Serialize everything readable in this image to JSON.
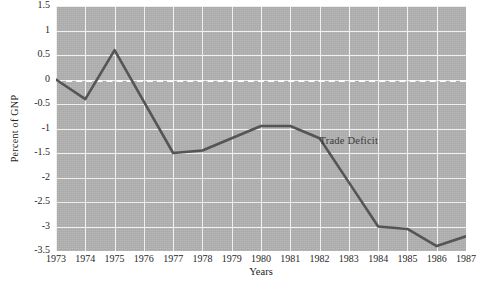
{
  "chart_data": {
    "type": "line",
    "title": "",
    "xlabel": "Years",
    "ylabel": "Percent of GNP",
    "categories": [
      "1973",
      "1974",
      "1975",
      "1976",
      "1977",
      "1978",
      "1979",
      "1980",
      "1981",
      "1982",
      "1983",
      "1984",
      "1985",
      "1986",
      "1987"
    ],
    "series": [
      {
        "name": "Trade Deficit",
        "values": [
          0.0,
          -0.4,
          0.6,
          -0.45,
          -1.5,
          -1.45,
          -1.2,
          -0.95,
          -0.95,
          -1.2,
          -2.1,
          -3.0,
          -3.05,
          -3.4,
          -3.2
        ]
      }
    ],
    "xlim": [
      1973,
      1987
    ],
    "ylim": [
      -3.5,
      1.5
    ],
    "yticks": [
      1.5,
      1,
      0.5,
      0,
      -0.5,
      -1,
      -1.5,
      -2,
      -2.5,
      -3,
      -3.5
    ],
    "ytick_labels": [
      "1.5",
      "1",
      "0.5",
      "0",
      "-0.5",
      "-1",
      "-1.5",
      "-2",
      "-2.5",
      "-3",
      "-3.5"
    ],
    "grid": true,
    "legend": "none",
    "zero_reference_line": true,
    "annotations": [
      {
        "text": "Trade Deficit",
        "x": 1982.0,
        "y": -1.28
      }
    ],
    "colors": {
      "plot_background": "#b2b2b2",
      "gridline": "#f0f0f0",
      "series_line": "#555555",
      "zero_line": "#fafafa",
      "text": "#1f1f1f"
    }
  }
}
